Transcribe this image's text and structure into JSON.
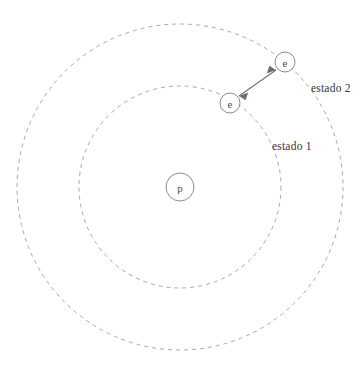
{
  "figure": {
    "type": "bohr-atom-transition-diagram",
    "width": 363,
    "height": 366,
    "background_color": "#ffffff"
  },
  "nucleus": {
    "label": "p",
    "name": "proton",
    "center_x": 180,
    "center_y": 187,
    "radius": 14,
    "stroke_color": "#8e8b91",
    "text_color": "#4d4a50"
  },
  "orbits": [
    {
      "id": "orbit-inner",
      "state_label": "estado 1",
      "center_x": 180,
      "center_y": 187,
      "radius": 101,
      "stroke_color": "#a9a6ab",
      "dash_pattern": "4 4"
    },
    {
      "id": "orbit-outer",
      "state_label": "estado 2",
      "center_x": 180,
      "center_y": 187,
      "radius": 163,
      "stroke_color": "#a9a6ab",
      "dash_pattern": "4 4"
    }
  ],
  "electrons": [
    {
      "id": "electron-inner",
      "label": "e",
      "orbit": "orbit-inner",
      "center_x": 230,
      "center_y": 103,
      "radius": 10
    },
    {
      "id": "electron-outer",
      "label": "e",
      "orbit": "orbit-outer",
      "center_x": 285,
      "center_y": 62,
      "radius": 10
    }
  ],
  "transition_arrow": {
    "name": "electron-transition-arrow",
    "double_headed": true,
    "from_x": 239,
    "from_y": 96,
    "to_x": 276,
    "to_y": 70,
    "color": "#6e6b72"
  },
  "labels": {
    "state_1": "estado 1",
    "state_2": "estado 2"
  }
}
